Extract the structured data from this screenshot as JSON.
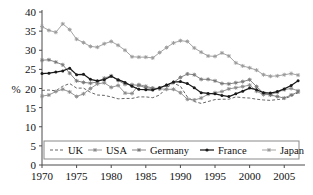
{
  "chart_data": {
    "type": "line",
    "title": "",
    "subtitle": "",
    "xlabel": "",
    "ylabel": "%",
    "xlim": [
      1970,
      2008
    ],
    "ylim": [
      0,
      40
    ],
    "grid": false,
    "legend_position": "bottom-inside",
    "x_ticks": [
      1970,
      1975,
      1980,
      1985,
      1990,
      1995,
      2000,
      2005
    ],
    "y_ticks": [
      0,
      5,
      10,
      15,
      20,
      25,
      30,
      35,
      40
    ],
    "x": [
      1970,
      1971,
      1972,
      1973,
      1974,
      1975,
      1976,
      1977,
      1978,
      1979,
      1980,
      1981,
      1982,
      1983,
      1984,
      1985,
      1986,
      1987,
      1988,
      1989,
      1990,
      1991,
      1992,
      1993,
      1994,
      1995,
      1996,
      1997,
      1998,
      1999,
      2000,
      2001,
      2002,
      2003,
      2004,
      2005,
      2006,
      2007
    ],
    "series": [
      {
        "name": "UK",
        "color": "#555555",
        "style": "dashed",
        "marker": "none",
        "values": [
          19.5,
          19.6,
          19.4,
          20.6,
          21.3,
          20.1,
          20.1,
          19.0,
          18.3,
          18.2,
          17.8,
          17.3,
          17.4,
          17.4,
          17.8,
          17.8,
          17.6,
          18.3,
          20.2,
          21.4,
          20.6,
          17.8,
          16.6,
          16.1,
          16.6,
          17.1,
          17.2,
          17.2,
          17.8,
          17.6,
          17.5,
          17.2,
          17.0,
          16.9,
          17.1,
          17.3,
          18.0,
          18.9
        ]
      },
      {
        "name": "USA",
        "color": "#8a8a8a",
        "style": "solid",
        "marker": "star",
        "values": [
          18.0,
          18.3,
          19.2,
          19.8,
          19.1,
          17.9,
          18.6,
          20.0,
          21.2,
          21.5,
          20.3,
          20.8,
          18.8,
          18.7,
          21.0,
          20.6,
          20.1,
          19.9,
          19.8,
          19.8,
          18.9,
          17.2,
          17.0,
          17.5,
          18.5,
          18.9,
          19.2,
          19.9,
          20.2,
          20.5,
          20.9,
          19.3,
          18.4,
          18.4,
          19.0,
          19.7,
          20.0,
          19.4
        ]
      },
      {
        "name": "Germany",
        "color": "#787878",
        "style": "solid",
        "marker": "star",
        "values": [
          27.4,
          27.5,
          26.9,
          26.2,
          24.0,
          22.0,
          21.6,
          21.4,
          21.7,
          22.7,
          23.3,
          22.1,
          21.1,
          21.0,
          20.8,
          20.2,
          20.0,
          20.1,
          20.8,
          21.6,
          22.9,
          23.8,
          23.6,
          22.4,
          22.4,
          22.0,
          21.3,
          21.2,
          21.5,
          21.8,
          22.3,
          20.5,
          18.8,
          18.3,
          17.9,
          17.5,
          18.3,
          19.1
        ]
      },
      {
        "name": "France",
        "color": "#1a1a1a",
        "style": "solid",
        "marker": "star",
        "values": [
          23.9,
          24.0,
          24.3,
          24.6,
          25.3,
          23.6,
          23.7,
          22.4,
          22.0,
          22.3,
          23.2,
          22.3,
          21.6,
          20.6,
          19.8,
          19.7,
          19.6,
          20.2,
          20.9,
          21.7,
          21.8,
          21.3,
          20.2,
          18.9,
          18.7,
          18.6,
          18.2,
          17.9,
          18.6,
          19.3,
          20.1,
          19.7,
          18.9,
          18.8,
          19.2,
          19.9,
          20.8,
          22.0
        ]
      },
      {
        "name": "Japan",
        "color": "#9a9a9a",
        "style": "solid",
        "marker": "star",
        "values": [
          36.2,
          35.2,
          34.7,
          36.9,
          35.4,
          32.9,
          32.0,
          31.0,
          30.8,
          31.7,
          32.3,
          31.3,
          30.0,
          28.3,
          28.2,
          28.2,
          28.0,
          29.4,
          30.7,
          31.9,
          32.5,
          32.3,
          30.6,
          29.5,
          28.5,
          28.4,
          29.3,
          28.5,
          26.7,
          25.9,
          25.4,
          24.8,
          23.6,
          23.2,
          23.3,
          23.6,
          23.9,
          23.5
        ]
      }
    ]
  },
  "legend": {
    "entries": [
      {
        "label": "UK"
      },
      {
        "label": "USA"
      },
      {
        "label": "Germany"
      },
      {
        "label": "France"
      },
      {
        "label": "Japan"
      }
    ]
  },
  "axes": {
    "y_axis_title": "%",
    "y_tick_labels": [
      "0",
      "5",
      "10",
      "15",
      "20",
      "25",
      "30",
      "35",
      "40"
    ],
    "x_tick_labels": [
      "1970",
      "1975",
      "1980",
      "1985",
      "1990",
      "1995",
      "2000",
      "2005"
    ]
  }
}
